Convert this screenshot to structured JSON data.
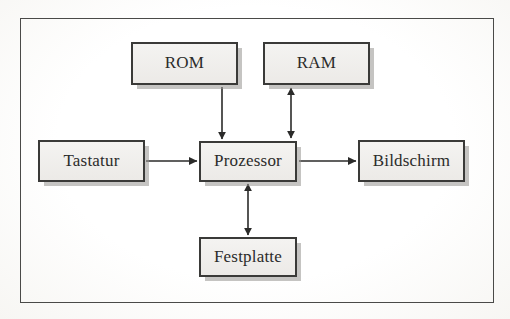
{
  "diagram": {
    "frame": {
      "style": "single thin rectangle border"
    },
    "nodes": [
      {
        "id": "rom",
        "label": "ROM"
      },
      {
        "id": "ram",
        "label": "RAM"
      },
      {
        "id": "tastatur",
        "label": "Tastatur"
      },
      {
        "id": "prozessor",
        "label": "Prozessor"
      },
      {
        "id": "bildschirm",
        "label": "Bildschirm"
      },
      {
        "id": "festplatte",
        "label": "Festplatte"
      }
    ],
    "edges": [
      {
        "id": "rom-to-prozessor",
        "from": "ROM",
        "to": "Prozessor",
        "direction": "one-way",
        "orientation": "vertical"
      },
      {
        "id": "ram-to-prozessor",
        "from": "RAM",
        "to": "Prozessor",
        "direction": "two-way",
        "orientation": "vertical"
      },
      {
        "id": "tastatur-to-prozessor",
        "from": "Tastatur",
        "to": "Prozessor",
        "direction": "one-way",
        "orientation": "horizontal"
      },
      {
        "id": "prozessor-to-bildschirm",
        "from": "Prozessor",
        "to": "Bildschirm",
        "direction": "one-way",
        "orientation": "horizontal"
      },
      {
        "id": "prozessor-to-festplatte",
        "from": "Prozessor",
        "to": "Festplatte",
        "direction": "two-way",
        "orientation": "vertical"
      }
    ],
    "colors": {
      "page_background": "#fdfdfb",
      "box_fill": "#f1efec",
      "box_border": "#3a3a38",
      "box_shadow": "#96948f",
      "line": "#2b2b2a",
      "frame_border": "#4a4a48",
      "text": "#2b2b2a"
    }
  }
}
